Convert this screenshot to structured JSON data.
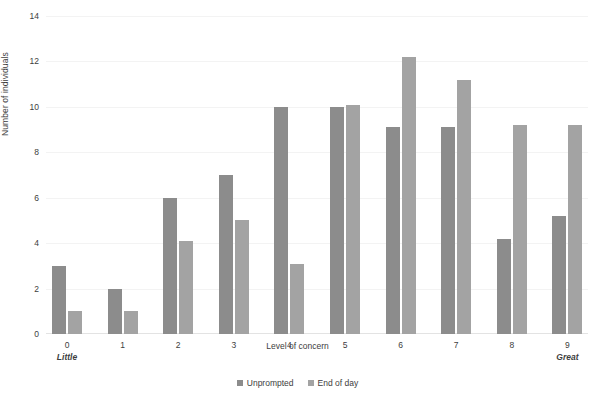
{
  "chart_data": {
    "type": "bar",
    "title": "",
    "subtitle": "",
    "xlabel": "Level of concern",
    "ylabel": "Number of individuals",
    "categories": [
      "0",
      "1",
      "2",
      "3",
      "4",
      "5",
      "6",
      "7",
      "8",
      "9"
    ],
    "category_end_labels": {
      "first": "Little",
      "last": "Great"
    },
    "series": [
      {
        "name": "Unprompted",
        "color": "#8c8c8c",
        "values": [
          3,
          2,
          6,
          7,
          10,
          10,
          9.1,
          9.1,
          4.2,
          5.2
        ]
      },
      {
        "name": "End of day",
        "color": "#a3a3a3",
        "values": [
          1,
          1,
          4.1,
          5,
          3.1,
          10.1,
          12.2,
          11.2,
          9.2,
          9.2
        ]
      }
    ],
    "ylim": [
      0,
      14
    ],
    "yticks": [
      0,
      2,
      4,
      6,
      8,
      10,
      12,
      14
    ],
    "ytick_labels": [
      "0",
      "2",
      "4",
      "6",
      "8",
      "10",
      "12",
      "14"
    ],
    "grid": true,
    "grid_axis": "y",
    "legend_position": "bottom"
  },
  "axes": {
    "y_title": "Number of individuals",
    "x_title": "Level of concern"
  },
  "legend": {
    "items": [
      {
        "label": "Unprompted",
        "color": "#8c8c8c"
      },
      {
        "label": "End of day",
        "color": "#a3a3a3"
      }
    ]
  },
  "colors": {
    "background": "#ffffff",
    "text": "#3d3d3d",
    "gridline": "#f3f3f3",
    "series_1": "#8c8c8c",
    "series_2": "#a3a3a3"
  }
}
